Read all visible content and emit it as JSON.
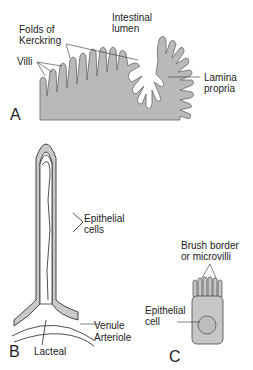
{
  "panels": [
    {
      "id": "A",
      "letter": "A",
      "labels": {
        "lumen": "Intestinal",
        "lumen2": "lumen",
        "folds": "Folds of",
        "folds2": "Kerckring",
        "villi": "Villi",
        "lamina": "Lamina",
        "lamina2": "propria"
      }
    },
    {
      "id": "B",
      "letter": "B",
      "labels": {
        "epi": "Epithelial",
        "epi2": "cells",
        "venule": "Venule",
        "arteriole": "Arteriole",
        "lacteal": "Lacteal"
      }
    },
    {
      "id": "C",
      "letter": "C",
      "labels": {
        "brush": "Brush border",
        "brush2": "or microvilli",
        "epi": "Epithelial",
        "epi2": "cell"
      }
    }
  ],
  "colors": {
    "tissue": "#b9b9b9",
    "outline": "#555555",
    "line": "#333333"
  }
}
